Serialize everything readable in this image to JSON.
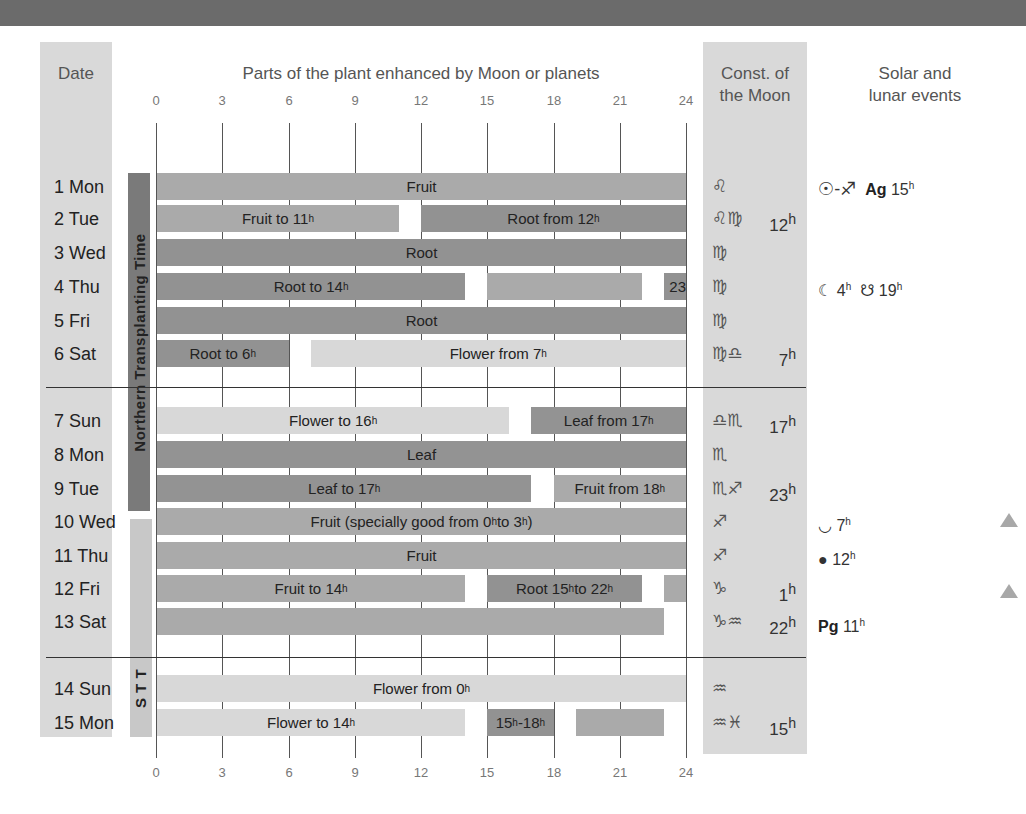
{
  "headers": {
    "date": "Date",
    "parts": "Parts of the plant enhanced by Moon or planets",
    "const_line1": "Const. of",
    "const_line2": "the Moon",
    "events_line1": "Solar and",
    "events_line2": "lunar events"
  },
  "axis": {
    "ticks": [
      "0",
      "3",
      "6",
      "9",
      "12",
      "15",
      "18",
      "21",
      "24"
    ]
  },
  "periods": {
    "northern": "Northern Transplanting Time",
    "stt": "S T T"
  },
  "colors": {
    "fruit": "#aaaaaa",
    "root": "#929292",
    "flower": "#d8d8d8",
    "leaf": "#939393",
    "header_bar": "#6b6b6b",
    "column_bg": "#d9d9d9",
    "period_dark": "#7a7a7a",
    "period_light": "#c8c8c8"
  },
  "rows": [
    {
      "date": "1 Mon",
      "const": "♌",
      "const_time": "",
      "event": "☉-♐ Ag 15ʰ"
    },
    {
      "date": "2 Tue",
      "const": "♌♍",
      "const_time": "12ʰ",
      "event": ""
    },
    {
      "date": "3 Wed",
      "const": "♍",
      "const_time": "",
      "event": ""
    },
    {
      "date": "4 Thu",
      "const": "♍",
      "const_time": "",
      "event": "☾ 4ʰ ☋ 19ʰ"
    },
    {
      "date": "5 Fri",
      "const": "♍",
      "const_time": "",
      "event": ""
    },
    {
      "date": "6 Sat",
      "const": "♍♎",
      "const_time": "7ʰ",
      "event": ""
    },
    {
      "date": "7 Sun",
      "const": "♎♏",
      "const_time": "17ʰ",
      "event": ""
    },
    {
      "date": "8 Mon",
      "const": "♏",
      "const_time": "",
      "event": ""
    },
    {
      "date": "9 Tue",
      "const": "♏♐",
      "const_time": "23ʰ",
      "event": ""
    },
    {
      "date": "10 Wed",
      "const": "♐",
      "const_time": "",
      "event": "☋ 7ʰ"
    },
    {
      "date": "11 Thu",
      "const": "♐",
      "const_time": "",
      "event": "● 12ʰ"
    },
    {
      "date": "12 Fri",
      "const": "♑",
      "const_time": "1ʰ",
      "event": ""
    },
    {
      "date": "13 Sat",
      "const": "♑♒",
      "const_time": "22ʰ",
      "event": "Pg 11ʰ"
    },
    {
      "date": "14 Sun",
      "const": "♒",
      "const_time": "",
      "event": ""
    },
    {
      "date": "15 Mon",
      "const": "♒♓",
      "const_time": "15ʰ",
      "event": ""
    }
  ],
  "events_text": {
    "e1_prefix": "☉-♐",
    "e1_bold": "Ag",
    "e1_time": "15",
    "e4_moon": "☾",
    "e4_moon_time": "4",
    "e4_node": "☋",
    "e4_node_time": "19",
    "e10_symbol": "◡",
    "e10_time": "7",
    "e11_symbol": "●",
    "e11_time": "12",
    "e13_bold": "Pg",
    "e13_time": "11",
    "sup_h": "h"
  },
  "chart_data": {
    "type": "bar",
    "subtype": "gantt",
    "title": "Parts of the plant enhanced by Moon or planets",
    "xlabel": "Hour of day",
    "xlim": [
      0,
      24
    ],
    "xticks": [
      0,
      3,
      6,
      9,
      12,
      15,
      18,
      21,
      24
    ],
    "categories": [
      "1 Mon",
      "2 Tue",
      "3 Wed",
      "4 Thu",
      "5 Fri",
      "6 Sat",
      "7 Sun",
      "8 Mon",
      "9 Tue",
      "10 Wed",
      "11 Thu",
      "12 Fri",
      "13 Sat",
      "14 Sun",
      "15 Mon"
    ],
    "legend": [
      "Fruit",
      "Root",
      "Flower",
      "Leaf"
    ],
    "segments": [
      {
        "day": "1 Mon",
        "start": 0,
        "end": 24,
        "type": "fruit",
        "label": "Fruit"
      },
      {
        "day": "2 Tue",
        "start": 0,
        "end": 11,
        "type": "fruit",
        "label": "Fruit to 11ʰ"
      },
      {
        "day": "2 Tue",
        "start": 12,
        "end": 24,
        "type": "root",
        "label": "Root from 12ʰ"
      },
      {
        "day": "3 Wed",
        "start": 0,
        "end": 24,
        "type": "root",
        "label": "Root"
      },
      {
        "day": "4 Thu",
        "start": 0,
        "end": 14,
        "type": "root",
        "label": "Root to 14ʰ"
      },
      {
        "day": "4 Thu",
        "start": 15,
        "end": 22,
        "type": "fruit",
        "label": ""
      },
      {
        "day": "4 Thu",
        "start": 23,
        "end": 24,
        "type": "root",
        "label": "23"
      },
      {
        "day": "5 Fri",
        "start": 0,
        "end": 24,
        "type": "root",
        "label": "Root"
      },
      {
        "day": "6 Sat",
        "start": 0,
        "end": 6,
        "type": "root",
        "label": "Root to 6ʰ"
      },
      {
        "day": "6 Sat",
        "start": 7,
        "end": 24,
        "type": "flower",
        "label": "Flower from 7ʰ"
      },
      {
        "day": "7 Sun",
        "start": 0,
        "end": 16,
        "type": "flower",
        "label": "Flower to 16ʰ"
      },
      {
        "day": "7 Sun",
        "start": 17,
        "end": 24,
        "type": "leaf",
        "label": "Leaf from 17ʰ"
      },
      {
        "day": "8 Mon",
        "start": 0,
        "end": 24,
        "type": "leaf",
        "label": "Leaf"
      },
      {
        "day": "9 Tue",
        "start": 0,
        "end": 17,
        "type": "leaf",
        "label": "Leaf to 17ʰ"
      },
      {
        "day": "9 Tue",
        "start": 18,
        "end": 24,
        "type": "fruit",
        "label": "Fruit from 18ʰ"
      },
      {
        "day": "10 Wed",
        "start": 0,
        "end": 24,
        "type": "fruit",
        "label": "Fruit (specially good from 0ʰ to 3ʰ )"
      },
      {
        "day": "11 Thu",
        "start": 0,
        "end": 24,
        "type": "fruit",
        "label": "Fruit"
      },
      {
        "day": "12 Fri",
        "start": 0,
        "end": 14,
        "type": "fruit",
        "label": "Fruit to 14ʰ"
      },
      {
        "day": "12 Fri",
        "start": 15,
        "end": 22,
        "type": "root",
        "label": "Root 15ʰ to 22ʰ"
      },
      {
        "day": "12 Fri",
        "start": 23,
        "end": 24,
        "type": "fruit",
        "label": ""
      },
      {
        "day": "13 Sat",
        "start": 0,
        "end": 23,
        "type": "fruit",
        "label": ""
      },
      {
        "day": "14 Sun",
        "start": 0,
        "end": 24,
        "type": "flower",
        "label": "Flower from 0ʰ"
      },
      {
        "day": "15 Mon",
        "start": 0,
        "end": 14,
        "type": "flower",
        "label": "Flower to 14ʰ"
      },
      {
        "day": "15 Mon",
        "start": 15,
        "end": 18,
        "type": "root",
        "label": "15ʰ-18ʰ"
      },
      {
        "day": "15 Mon",
        "start": 19,
        "end": 23,
        "type": "fruit",
        "label": ""
      }
    ],
    "periods": [
      {
        "label": "Northern Transplanting Time",
        "from": "1 Mon",
        "to": "9 Tue"
      },
      {
        "label": "S T T",
        "from": "10 Wed",
        "to": "15 Mon"
      }
    ],
    "grid": true
  }
}
